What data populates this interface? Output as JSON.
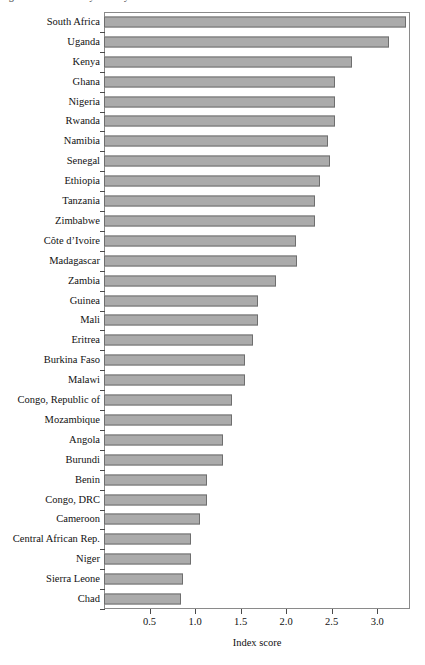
{
  "figure": {
    "title_sliver": "Figure: Index score by country",
    "axis": {
      "x_label": "Index score",
      "x_ticks": [
        "0.5",
        "1.0",
        "1.5",
        "2.0",
        "2.5",
        "3.0"
      ],
      "x_tick_values": [
        0.5,
        1.0,
        1.5,
        2.0,
        2.5,
        3.0
      ],
      "x_min": 0,
      "x_max": 3.36
    },
    "colors": {
      "bar_fill": "#ababab",
      "bar_border": "#6e6e6e",
      "frame": "#8a8a8a",
      "text": "#111111"
    }
  },
  "chart_data": {
    "type": "bar",
    "orientation": "horizontal",
    "title": "Index score by country",
    "xlabel": "Index score",
    "ylabel": "",
    "xlim": [
      0,
      3.36
    ],
    "grid": false,
    "legend": false,
    "categories": [
      "South Africa",
      "Uganda",
      "Kenya",
      "Ghana",
      "Nigeria",
      "Rwanda",
      "Namibia",
      "Senegal",
      "Ethiopia",
      "Tanzania",
      "Zimbabwe",
      "Côte d’Ivoire",
      "Madagascar",
      "Zambia",
      "Guinea",
      "Mali",
      "Eritrea",
      "Burkina Faso",
      "Malawi",
      "Congo, Republic of",
      "Mozambique",
      "Angola",
      "Burundi",
      "Benin",
      "Congo, DRC",
      "Cameroon",
      "Central African Rep.",
      "Niger",
      "Sierra Leone",
      "Chad"
    ],
    "values": [
      3.32,
      3.13,
      2.72,
      2.54,
      2.54,
      2.54,
      2.46,
      2.48,
      2.37,
      2.32,
      2.32,
      2.11,
      2.12,
      1.89,
      1.69,
      1.69,
      1.64,
      1.55,
      1.55,
      1.41,
      1.41,
      1.31,
      1.31,
      1.13,
      1.13,
      1.05,
      0.95,
      0.95,
      0.87,
      0.84
    ]
  }
}
